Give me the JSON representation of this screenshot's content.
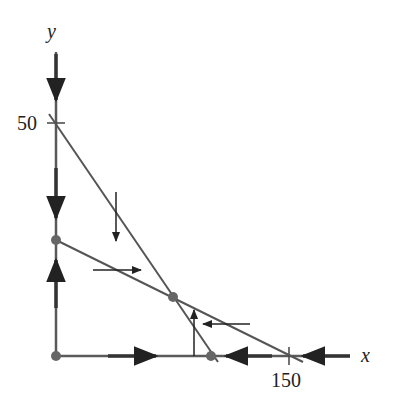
{
  "diagram": {
    "type": "phase-portrait",
    "axes": {
      "x_label": "x",
      "y_label": "y",
      "x_tick_label": "150",
      "y_tick_label": "50"
    },
    "lines": [
      {
        "name": "isocline-1",
        "from": [
          0,
          50
        ],
        "to": [
          104,
          0
        ]
      },
      {
        "name": "isocline-2",
        "from": [
          0,
          26
        ],
        "to": [
          150,
          0
        ]
      }
    ],
    "equilibria": [
      {
        "name": "origin",
        "x": 0,
        "y": 0
      },
      {
        "name": "y-intercept",
        "x": 0,
        "y": 26
      },
      {
        "name": "interior",
        "x": 75,
        "y": 13
      },
      {
        "name": "x-intercept",
        "x": 104,
        "y": 0
      }
    ],
    "arrows": [
      {
        "name": "y-axis-down-top",
        "direction": "down"
      },
      {
        "name": "y-axis-down-mid",
        "direction": "down"
      },
      {
        "name": "y-axis-up-low",
        "direction": "up"
      },
      {
        "name": "x-axis-right",
        "direction": "right"
      },
      {
        "name": "x-axis-left-mid",
        "direction": "left"
      },
      {
        "name": "x-axis-left-far",
        "direction": "left"
      },
      {
        "name": "region-down",
        "direction": "down"
      },
      {
        "name": "region-right",
        "direction": "right"
      },
      {
        "name": "region-up",
        "direction": "up"
      },
      {
        "name": "region-left",
        "direction": "left"
      }
    ],
    "colors": {
      "axis": "#5a5a5a",
      "line": "#555555",
      "dot": "#666666",
      "arrow": "#222222"
    }
  }
}
